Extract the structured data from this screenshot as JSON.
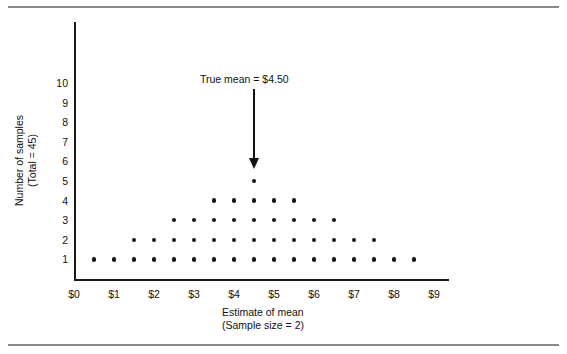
{
  "chart_data": {
    "type": "scatter",
    "title": "",
    "xlabel": "Estimate of mean",
    "xlabel_line2": "(Sample size = 2)",
    "ylabel": "Number of samples",
    "ylabel_line2": "(Total = 45)",
    "xlim": [
      0,
      9.4
    ],
    "ylim": [
      0,
      10.6
    ],
    "grid": false,
    "legend": null,
    "x_tick_labels": [
      "$0",
      "$1",
      "$2",
      "$3",
      "$4",
      "$5",
      "$6",
      "$7",
      "$8",
      "$9"
    ],
    "x_tick_values": [
      0,
      1,
      2,
      3,
      4,
      5,
      6,
      7,
      8,
      9
    ],
    "y_tick_labels": [
      "1",
      "2",
      "3",
      "4",
      "5",
      "6",
      "7",
      "8",
      "9",
      "10"
    ],
    "y_tick_values": [
      1,
      2,
      3,
      4,
      5,
      6,
      7,
      8,
      9,
      10
    ],
    "total_samples": 45,
    "dot_color": "#111111",
    "axis_color": "#1a1a1a",
    "stacks": [
      {
        "x": 0.5,
        "count": 1
      },
      {
        "x": 1.0,
        "count": 1
      },
      {
        "x": 1.5,
        "count": 2
      },
      {
        "x": 2.0,
        "count": 2
      },
      {
        "x": 2.5,
        "count": 3
      },
      {
        "x": 3.0,
        "count": 3
      },
      {
        "x": 3.5,
        "count": 4
      },
      {
        "x": 4.0,
        "count": 4
      },
      {
        "x": 4.5,
        "count": 5
      },
      {
        "x": 5.0,
        "count": 4
      },
      {
        "x": 5.5,
        "count": 4
      },
      {
        "x": 6.0,
        "count": 3
      },
      {
        "x": 6.5,
        "count": 3
      },
      {
        "x": 7.0,
        "count": 2
      },
      {
        "x": 7.5,
        "count": 2
      },
      {
        "x": 8.0,
        "count": 1
      },
      {
        "x": 8.5,
        "count": 1
      }
    ],
    "annotations": [
      {
        "text": "True mean = $4.50",
        "x": 4.5,
        "arrow_from_y": 9.7,
        "arrow_to_y": 5.6
      }
    ]
  }
}
